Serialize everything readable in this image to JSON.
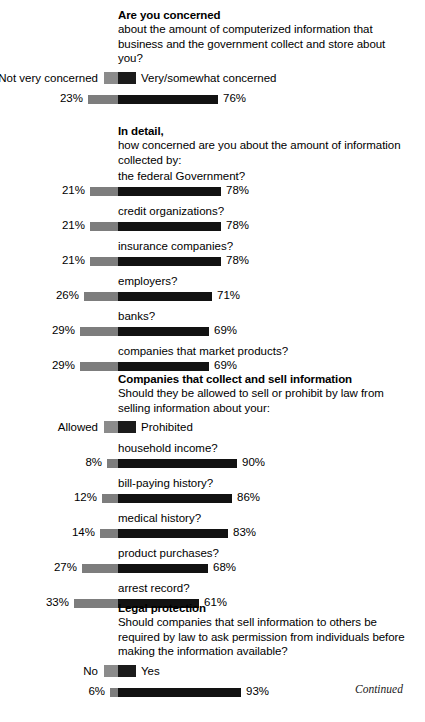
{
  "document": {
    "continued_note": "Continued",
    "bar_scale_px_per_percent": 1.32,
    "center_x_px": 118,
    "colors": {
      "left_segment": "#7d7d7d",
      "right_segment": "#121212",
      "text": "#000000",
      "background": "#ffffff"
    }
  },
  "chart_data": {
    "type": "bar",
    "title": "Are you concerned",
    "subtitle": "about the amount of computerized information that business and the government collect and store about you?",
    "orientation": "horizontal-diverging",
    "xlabel": "",
    "ylabel": "",
    "xlim": [
      0,
      100
    ],
    "grid": false,
    "legend_position": "above-bars",
    "note": "Diverging bars anchored at a common center. Left segment = first legend category, right segment = second legend category. Values are percents.",
    "sections": [
      {
        "title": "Are you concerned",
        "subtitle": "about the amount of computerized information that business and the government collect and store about you?",
        "legend": {
          "left_label": "Not very concerned",
          "right_label": "Very/somewhat concerned"
        },
        "rows": [
          {
            "label": "",
            "left_value": 23,
            "right_value": 76,
            "left_text": "23%",
            "right_text": "76%"
          }
        ]
      },
      {
        "title": "In detail,",
        "subtitle": "how concerned are you about the amount of information collected by:",
        "legend": null,
        "rows": [
          {
            "label": "the federal Government?",
            "left_value": 21,
            "right_value": 78,
            "left_text": "21%",
            "right_text": "78%"
          },
          {
            "label": "credit organizations?",
            "left_value": 21,
            "right_value": 78,
            "left_text": "21%",
            "right_text": "78%"
          },
          {
            "label": "insurance companies?",
            "left_value": 21,
            "right_value": 78,
            "left_text": "21%",
            "right_text": "78%"
          },
          {
            "label": "employers?",
            "left_value": 26,
            "right_value": 71,
            "left_text": "26%",
            "right_text": "71%"
          },
          {
            "label": "banks?",
            "left_value": 29,
            "right_value": 69,
            "left_text": "29%",
            "right_text": "69%"
          },
          {
            "label": "companies that market products?",
            "left_value": 29,
            "right_value": 69,
            "left_text": "29%",
            "right_text": "69%"
          }
        ]
      },
      {
        "title": "Companies that collect and sell information",
        "subtitle": "Should they be allowed to sell or prohibit by law from selling information about your:",
        "legend": {
          "left_label": "Allowed",
          "right_label": "Prohibited"
        },
        "rows": [
          {
            "label": "household income?",
            "left_value": 8,
            "right_value": 90,
            "left_text": "8%",
            "right_text": "90%"
          },
          {
            "label": "bill-paying history?",
            "left_value": 12,
            "right_value": 86,
            "left_text": "12%",
            "right_text": "86%"
          },
          {
            "label": "medical history?",
            "left_value": 14,
            "right_value": 83,
            "left_text": "14%",
            "right_text": "83%"
          },
          {
            "label": "product purchases?",
            "left_value": 27,
            "right_value": 68,
            "left_text": "27%",
            "right_text": "68%"
          },
          {
            "label": "arrest record?",
            "left_value": 33,
            "right_value": 61,
            "left_text": "33%",
            "right_text": "61%"
          }
        ]
      },
      {
        "title": "Legal protection",
        "subtitle": "Should companies that sell information to others be required by law to ask permission from individuals before making the information available?",
        "legend": {
          "left_label": "No",
          "right_label": "Yes"
        },
        "rows": [
          {
            "label": "",
            "left_value": 6,
            "right_value": 93,
            "left_text": "6%",
            "right_text": "93%"
          }
        ]
      }
    ]
  }
}
